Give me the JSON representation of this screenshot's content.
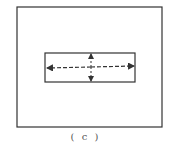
{
  "diagram": {
    "caption": "( c )",
    "outer_rect": {
      "x": 17,
      "y": 7,
      "w": 145,
      "h": 120
    },
    "inner_rect": {
      "x": 45,
      "y": 53,
      "w": 90,
      "h": 29
    },
    "arrows": [
      "horizontal-double-arrow-dashed",
      "vertical-double-arrow-dashed"
    ],
    "colors": {
      "stroke": "#333333",
      "background": "#ffffff"
    }
  }
}
